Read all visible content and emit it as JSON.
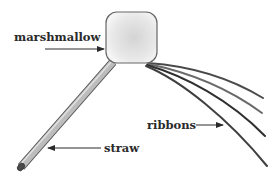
{
  "diagram": {
    "labels": {
      "marshmallow": "marshmallow",
      "ribbons": "ribbons",
      "straw": "straw"
    },
    "colors": {
      "text": "#2a2a2a",
      "outline": "#555555",
      "ribbon_dark": "#3a3a3a",
      "ribbon_light": "#6a6a6a",
      "marshmallow_fill_center": "#d8d8d8",
      "marshmallow_fill_edge": "#f4f4f4",
      "straw_fill": "#c4c4c4",
      "straw_cap": "#555555"
    },
    "parts": [
      {
        "name": "marshmallow",
        "shape": "rounded-square"
      },
      {
        "name": "straw",
        "shape": "cylinder"
      },
      {
        "name": "ribbons",
        "count": 4,
        "shape": "curved-strips"
      }
    ]
  }
}
